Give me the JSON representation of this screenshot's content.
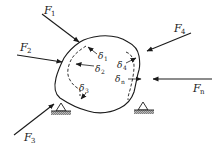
{
  "diagram": {
    "forces": [
      {
        "id": "F1",
        "label": "F",
        "sub": "1"
      },
      {
        "id": "F2",
        "label": "F",
        "sub": "2"
      },
      {
        "id": "F3",
        "label": "F",
        "sub": "3"
      },
      {
        "id": "F4",
        "label": "F",
        "sub": "4"
      },
      {
        "id": "Fn",
        "label": "F",
        "sub": "n"
      }
    ],
    "displacements": [
      {
        "id": "d1",
        "label": "δ",
        "sub": "1"
      },
      {
        "id": "d2",
        "label": "δ",
        "sub": "2"
      },
      {
        "id": "d3",
        "label": "δ",
        "sub": "3"
      },
      {
        "id": "d4",
        "label": "δ",
        "sub": "4"
      },
      {
        "id": "dn",
        "label": "δ",
        "sub": "n"
      }
    ],
    "supports": [
      "pin-support-left",
      "pin-support-right"
    ],
    "colors": {
      "ink": "#1a1a1a",
      "background": "#ffffff",
      "hatch": "#777777"
    }
  }
}
